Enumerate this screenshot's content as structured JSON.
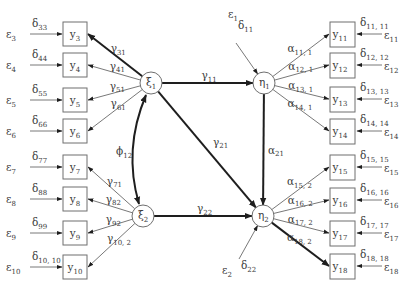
{
  "diagram": {
    "type": "structural-equation-model",
    "latent_exogenous": [
      {
        "id": "xi1",
        "symbol": "ξ",
        "sub": "1",
        "cx": 151,
        "cy": 83
      },
      {
        "id": "xi2",
        "symbol": "ξ",
        "sub": "2",
        "cx": 143,
        "cy": 216
      }
    ],
    "latent_endogenous": [
      {
        "id": "eta1",
        "symbol": "η",
        "sub": "1",
        "cx": 264,
        "cy": 83
      },
      {
        "id": "eta2",
        "symbol": "η",
        "sub": "2",
        "cx": 263,
        "cy": 216
      }
    ],
    "node_radius": 11,
    "left_indicators": [
      {
        "var": "y",
        "sub": "3",
        "y": 22,
        "delta": "33",
        "eps": "3",
        "path": "31",
        "from": "xi1",
        "thick": true
      },
      {
        "var": "y",
        "sub": "4",
        "y": 53,
        "delta": "44",
        "eps": "4",
        "path": "41",
        "from": "xi1",
        "thick": false
      },
      {
        "var": "y",
        "sub": "5",
        "y": 88,
        "delta": "55",
        "eps": "5",
        "path": "51",
        "from": "xi1",
        "thick": false
      },
      {
        "var": "y",
        "sub": "6",
        "y": 119,
        "delta": "66",
        "eps": "6",
        "path": "61",
        "from": "xi1",
        "thick": false
      },
      {
        "var": "y",
        "sub": "7",
        "y": 155,
        "delta": "77",
        "eps": "7",
        "path": "71",
        "from": "xi2",
        "thick": false
      },
      {
        "var": "y",
        "sub": "8",
        "y": 187,
        "delta": "88",
        "eps": "8",
        "path": "82",
        "from": "xi2",
        "thick": false
      },
      {
        "var": "y",
        "sub": "9",
        "y": 221,
        "delta": "99",
        "eps": "9",
        "path": "92",
        "from": "xi2",
        "thick": false
      },
      {
        "var": "y",
        "sub": "10",
        "y": 255,
        "delta": "10, 10",
        "eps": "10",
        "path": "10, 2",
        "from": "xi2",
        "thick": false
      }
    ],
    "right_indicators": [
      {
        "var": "y",
        "sub": "11",
        "y": 22,
        "delta": "11, 11",
        "eps": "11",
        "path": "11, 1",
        "from": "eta1",
        "thick": false
      },
      {
        "var": "y",
        "sub": "12",
        "y": 53,
        "delta": "12, 12",
        "eps": "12",
        "path": "12, 1",
        "from": "eta1",
        "thick": false
      },
      {
        "var": "y",
        "sub": "13",
        "y": 87,
        "delta": "13, 13",
        "eps": "13",
        "path": "13, 1",
        "from": "eta1",
        "thick": false
      },
      {
        "var": "y",
        "sub": "14",
        "y": 119,
        "delta": "14, 14",
        "eps": "14",
        "path": "14, 1",
        "from": "eta1",
        "thick": false
      },
      {
        "var": "y",
        "sub": "15",
        "y": 155,
        "delta": "15, 15",
        "eps": "15",
        "path": "15, 2",
        "from": "eta2",
        "thick": false
      },
      {
        "var": "y",
        "sub": "16",
        "y": 188,
        "delta": "16, 16",
        "eps": "16",
        "path": "16, 2",
        "from": "eta2",
        "thick": false
      },
      {
        "var": "y",
        "sub": "17",
        "y": 221,
        "delta": "17, 17",
        "eps": "17",
        "path": "17, 2",
        "from": "eta2",
        "thick": false
      },
      {
        "var": "y",
        "sub": "18",
        "y": 254,
        "delta": "18, 18",
        "eps": "18",
        "path": "18, 2",
        "from": "eta2",
        "thick": true
      }
    ],
    "structural_paths": [
      {
        "from": "xi1",
        "to": "eta1",
        "symbol": "γ",
        "sub": "11",
        "thick": true
      },
      {
        "from": "xi1",
        "to": "eta2",
        "symbol": "γ",
        "sub": "21",
        "thick": true
      },
      {
        "from": "eta1",
        "to": "eta2",
        "symbol": "α",
        "sub": "21",
        "thick": true
      },
      {
        "from": "xi2",
        "to": "eta2",
        "symbol": "γ",
        "sub": "22",
        "thick": true
      }
    ],
    "covariance": {
      "between": [
        "xi1",
        "xi2"
      ],
      "symbol": "ϕ",
      "sub": "12"
    },
    "disturbances": [
      {
        "target": "eta1",
        "eps_symbol": "ε",
        "eps_sub": "1",
        "delta_symbol": "δ",
        "delta_sub": "11"
      },
      {
        "target": "eta2",
        "eps_symbol": "ε",
        "eps_sub": "2",
        "delta_symbol": "δ",
        "delta_sub": "22"
      }
    ],
    "colors": {
      "box_stroke": "#6f6f6f",
      "thin_line": "#555555",
      "thick_line": "#1e1e1e",
      "text": "#3a3a3a",
      "background": "#ffffff"
    }
  }
}
